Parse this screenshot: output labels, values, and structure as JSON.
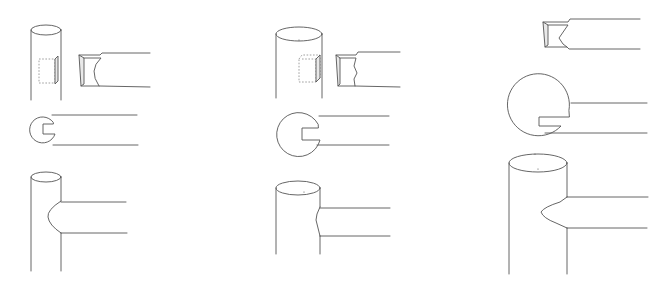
{
  "figure": {
    "colors": {
      "background": "#ffffff",
      "ink": "#555555",
      "hidden_line": "#888888",
      "shade": "#e9e9e9"
    },
    "variants": [
      {
        "id": "variant-1",
        "label": "",
        "post": "narrow round post",
        "tenon_profile": "concave scribe",
        "plan": "small circle with notch",
        "assembled_scribe": "rounded"
      },
      {
        "id": "variant-2",
        "label": "",
        "post": "medium round post",
        "tenon_profile": "wavy scribe",
        "plan": "medium circle with notch",
        "assembled_scribe": "shallow"
      },
      {
        "id": "variant-3",
        "label": "",
        "post": "wide round post",
        "tenon_profile": "V scribe",
        "plan": "large circle with notch",
        "assembled_scribe": "pointed"
      }
    ],
    "text_labels": []
  }
}
